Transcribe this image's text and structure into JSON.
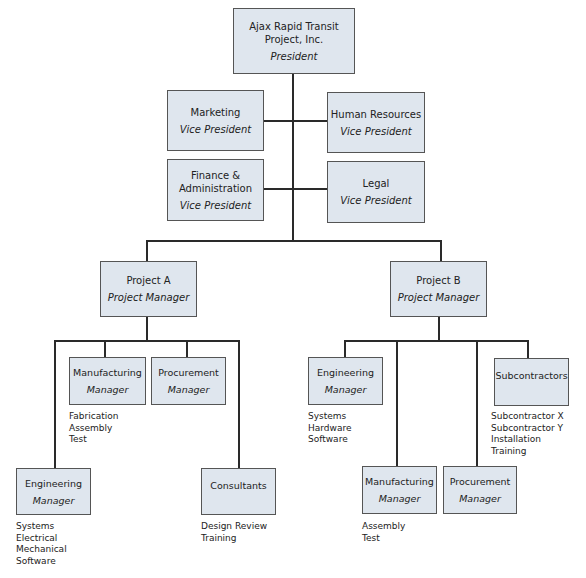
{
  "chart": {
    "root": {
      "name_line1": "Ajax Rapid Transit",
      "name_line2": "Project, Inc.",
      "role": "President"
    },
    "vps": [
      {
        "name": "Marketing",
        "role": "Vice President"
      },
      {
        "name": "Human Resources",
        "role": "Vice President"
      },
      {
        "name_line1": "Finance &",
        "name_line2": "Administration",
        "role": "Vice President"
      },
      {
        "name": "Legal",
        "role": "Vice President"
      }
    ],
    "projects": [
      {
        "name": "Project A",
        "role": "Project Manager",
        "units": [
          {
            "name": "Manufacturing",
            "role": "Manager",
            "notes": [
              "Fabrication",
              "Assembly",
              "Test"
            ]
          },
          {
            "name": "Procurement",
            "role": "Manager",
            "notes": []
          },
          {
            "name": "Engineering",
            "role": "Manager",
            "notes": [
              "Systems",
              "Electrical",
              "Mechanical",
              "Software"
            ]
          },
          {
            "name": "Consultants",
            "role": "",
            "notes": [
              "Design Review",
              "Training"
            ]
          }
        ]
      },
      {
        "name": "Project B",
        "role": "Project Manager",
        "units": [
          {
            "name": "Engineering",
            "role": "Manager",
            "notes": [
              "Systems",
              "Hardware",
              "Software"
            ]
          },
          {
            "name": "Subcontractors",
            "role": "",
            "notes": [
              "Subcontractor X",
              "Subcontractor Y",
              "Installation",
              "Training"
            ]
          },
          {
            "name": "Manufacturing",
            "role": "Manager",
            "notes": [
              "Assembly",
              "Test"
            ]
          },
          {
            "name": "Procurement",
            "role": "Manager",
            "notes": []
          }
        ]
      }
    ]
  },
  "colors": {
    "box_fill": "#dfe6ee",
    "box_border": "#555555",
    "connector": "#2a2a2a"
  }
}
